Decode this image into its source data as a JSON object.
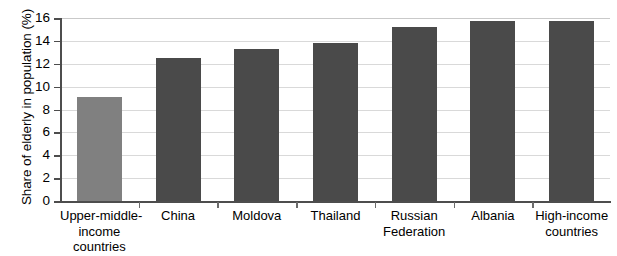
{
  "chart_data": {
    "type": "bar",
    "title": "",
    "xlabel": "",
    "ylabel": "Share of elderly in population (%)",
    "categories": [
      "Upper-middle-income countries",
      "China",
      "Moldova",
      "Thailand",
      "Russian Federation",
      "Albania",
      "High-income countries"
    ],
    "category_lines": [
      [
        "Upper-middle-",
        "income",
        "countries"
      ],
      [
        "China"
      ],
      [
        "Moldova"
      ],
      [
        "Thailand"
      ],
      [
        "Russian",
        "Federation"
      ],
      [
        "Albania"
      ],
      [
        "High-income",
        "countries"
      ]
    ],
    "values": [
      9.1,
      12.5,
      13.3,
      13.8,
      15.2,
      15.7,
      15.7
    ],
    "bar_colors": [
      "#808080",
      "#4a4a4a",
      "#4a4a4a",
      "#4a4a4a",
      "#4a4a4a",
      "#4a4a4a",
      "#4a4a4a"
    ],
    "ylim": [
      0,
      16
    ],
    "yticks": [
      0,
      2,
      4,
      6,
      8,
      10,
      12,
      14,
      16
    ],
    "ytick_labels": [
      "0",
      "2",
      "4",
      "6",
      "8",
      "10",
      "12",
      "14",
      "16"
    ],
    "grid": true,
    "grid_color": "#d9d9d9",
    "legend": null,
    "legend_position": "none",
    "axis_color": "#4d4d4d",
    "background": "#ffffff"
  }
}
